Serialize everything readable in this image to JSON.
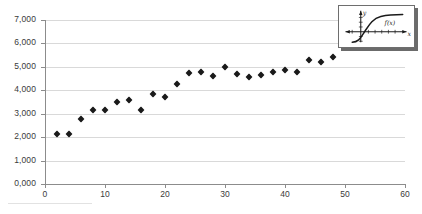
{
  "chart_data": {
    "type": "scatter",
    "title": "",
    "xlabel": "",
    "ylabel": "",
    "xlim": [
      0,
      60
    ],
    "ylim": [
      0,
      7000
    ],
    "grid": true,
    "legend": "none",
    "marker": "diamond",
    "marker_color": "#1a1a1a",
    "y_ticks": [
      "0,000",
      "1,000",
      "2,000",
      "3,000",
      "4,000",
      "5,000",
      "6,000",
      "7,000"
    ],
    "y_tick_values": [
      0,
      1000,
      2000,
      3000,
      4000,
      5000,
      6000,
      7000
    ],
    "x_ticks": [
      "0",
      "10",
      "20",
      "30",
      "40",
      "50",
      "60"
    ],
    "x_tick_values": [
      0,
      10,
      20,
      30,
      40,
      50,
      60
    ],
    "x": [
      2,
      4,
      6,
      8,
      10,
      12,
      14,
      16,
      18,
      20,
      22,
      24,
      26,
      28,
      30,
      32,
      34,
      36,
      38,
      40,
      42,
      44,
      46,
      48
    ],
    "y": [
      2150,
      2150,
      2780,
      3150,
      3150,
      3500,
      3600,
      3150,
      3850,
      3700,
      4250,
      4750,
      4800,
      4600,
      5000,
      4700,
      4550,
      4650,
      4800,
      4850,
      4800,
      5300,
      5200,
      5400
    ],
    "points": [
      {
        "x": 2,
        "y": 2150
      },
      {
        "x": 4,
        "y": 2150
      },
      {
        "x": 6,
        "y": 2780
      },
      {
        "x": 8,
        "y": 3150
      },
      {
        "x": 10,
        "y": 3150
      },
      {
        "x": 12,
        "y": 3500
      },
      {
        "x": 14,
        "y": 3600
      },
      {
        "x": 16,
        "y": 3150
      },
      {
        "x": 18,
        "y": 3850
      },
      {
        "x": 20,
        "y": 3700
      },
      {
        "x": 22,
        "y": 4250
      },
      {
        "x": 24,
        "y": 4750
      },
      {
        "x": 26,
        "y": 4800
      },
      {
        "x": 28,
        "y": 4600
      },
      {
        "x": 30,
        "y": 5000
      },
      {
        "x": 32,
        "y": 4700
      },
      {
        "x": 34,
        "y": 4550
      },
      {
        "x": 36,
        "y": 4650
      },
      {
        "x": 38,
        "y": 4800
      },
      {
        "x": 40,
        "y": 4850
      },
      {
        "x": 42,
        "y": 4800
      },
      {
        "x": 44,
        "y": 5300
      },
      {
        "x": 46,
        "y": 5200
      },
      {
        "x": 48,
        "y": 5400
      }
    ]
  },
  "inset": {
    "name": "function-graph-thumbnail",
    "y_axis_label": "y",
    "x_axis_label": "x",
    "curve_label": "f(x)"
  },
  "colors": {
    "gridline": "#d9d9d9",
    "axis": "#8c8c8c",
    "marker": "#1a1a1a",
    "text": "#3a3a3a",
    "background": "#ffffff",
    "inset_shadow": "#6b6b6b"
  }
}
